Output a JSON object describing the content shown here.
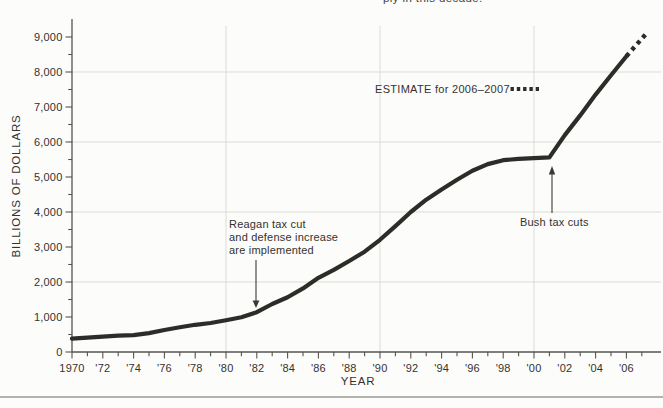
{
  "page": {
    "caption_fragment": "ply in this decade."
  },
  "colors": {
    "line": "#2d2c29",
    "grid": "#dbdbd6",
    "axis": "#55544f",
    "text": "#343230",
    "background": "#fcfcfa"
  },
  "chart_data": {
    "type": "line",
    "title": "",
    "xlabel": "YEAR",
    "ylabel": "BILLIONS OF DOLLARS",
    "xlim": [
      1970,
      2008
    ],
    "ylim": [
      0,
      9500
    ],
    "grid": "vertical lines at decade years, horizontal lines at even thousands",
    "legend_label": "ESTIMATE for 2006–2007",
    "legend_position": "upper-middle",
    "x_tick_years": [
      1970,
      1972,
      1974,
      1976,
      1978,
      1980,
      1982,
      1984,
      1986,
      1988,
      1990,
      1992,
      1994,
      1996,
      1998,
      2000,
      2002,
      2004,
      2006
    ],
    "x_tick_labels": [
      "1970",
      "'72",
      "'74",
      "'76",
      "'78",
      "'80",
      "'82",
      "'84",
      "'86",
      "'88",
      "'90",
      "'92",
      "'94",
      "'96",
      "'98",
      "'00",
      "'02",
      "'04",
      "'06"
    ],
    "x_minor_tick_years": [
      1971,
      1973,
      1975,
      1977,
      1979,
      1981,
      1983,
      1985,
      1987,
      1989,
      1991,
      1993,
      1995,
      1997,
      1999,
      2001,
      2003,
      2005,
      2007
    ],
    "y_tick_values": [
      0,
      1000,
      2000,
      3000,
      4000,
      5000,
      6000,
      7000,
      8000,
      9000
    ],
    "y_tick_labels": [
      "0",
      "1,000",
      "2,000",
      "3,000",
      "4,000",
      "5,000",
      "6,000",
      "7,000",
      "8,000",
      "9,000"
    ],
    "y_minor_tick_values": [
      500,
      1500,
      2500,
      3500,
      4500,
      5500,
      6500,
      7500,
      8500
    ],
    "grid_x_years": [
      1980,
      1990,
      2000
    ],
    "grid_y_values": [
      2000,
      4000,
      6000,
      8000
    ],
    "series": [
      {
        "name": "Federal debt, billions of dollars",
        "style": "solid",
        "x": [
          1970,
          1971,
          1972,
          1973,
          1974,
          1975,
          1976,
          1977,
          1978,
          1979,
          1980,
          1981,
          1982,
          1983,
          1984,
          1985,
          1986,
          1987,
          1988,
          1989,
          1990,
          1991,
          1992,
          1993,
          1994,
          1995,
          1996,
          1997,
          1998,
          1999,
          2000,
          2001,
          2002,
          2003,
          2004,
          2005,
          2006
        ],
        "y": [
          381,
          408,
          436,
          466,
          484,
          541,
          629,
          706,
          776,
          829,
          909,
          994,
          1137,
          1371,
          1564,
          1817,
          2120,
          2346,
          2601,
          2867,
          3206,
          3598,
          4001,
          4351,
          4643,
          4920,
          5181,
          5369,
          5480,
          5520,
          5540,
          5560,
          6198,
          6760,
          7354,
          7905,
          8451
        ]
      },
      {
        "name": "ESTIMATE for 2006–2007",
        "style": "dashed",
        "x": [
          2006,
          2007.4
        ],
        "y": [
          8451,
          9150
        ]
      }
    ],
    "annotations": [
      {
        "lines": [
          "Reagan tax cut",
          "and defense increase",
          "are implemented"
        ],
        "target_year": 1982,
        "target_value": 1140,
        "arrow_direction": "down"
      },
      {
        "lines": [
          "Bush tax cuts"
        ],
        "target_year": 2001,
        "target_value": 5560,
        "arrow_direction": "up"
      }
    ]
  }
}
